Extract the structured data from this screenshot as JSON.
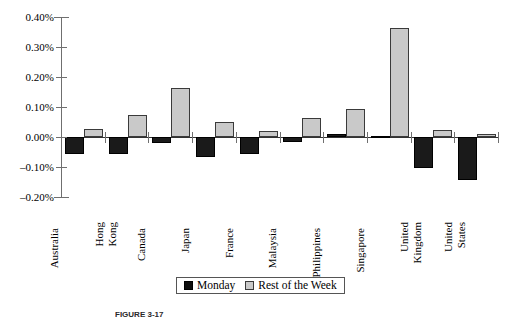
{
  "chart_data": {
    "type": "bar",
    "title": "",
    "subtitle": "",
    "xlabel": "",
    "ylabel": "",
    "ylim": [
      -0.2,
      0.4
    ],
    "ytick_values": [
      0.4,
      0.3,
      0.2,
      0.1,
      0.0,
      -0.1,
      -0.2
    ],
    "ytick_labels": [
      "0.40%",
      "0.30%",
      "0.20%",
      "0.10%",
      "0.00%",
      "–0.10%",
      "–0.20%"
    ],
    "grid": false,
    "legend_position": "bottom-center",
    "value_unit": "percent",
    "categories": [
      "Australia",
      "Hong Kong",
      "Canada",
      "Japan",
      "France",
      "Malaysia",
      "Philippines",
      "Singapore",
      "United Kingdom",
      "United States"
    ],
    "category_label_lines": [
      [
        "Australia"
      ],
      [
        "Hong",
        "Kong"
      ],
      [
        "Canada"
      ],
      [
        "Japan"
      ],
      [
        "France"
      ],
      [
        "Malaysia"
      ],
      [
        "Philippines"
      ],
      [
        "Singapore"
      ],
      [
        "United",
        "Kingdom"
      ],
      [
        "United",
        "States"
      ]
    ],
    "series": [
      {
        "name": "Monday",
        "color": "#1a1a1a",
        "values": [
          -0.055,
          -0.058,
          -0.02,
          -0.065,
          -0.055,
          -0.018,
          0.01,
          0.004,
          -0.103,
          -0.143
        ]
      },
      {
        "name": "Rest of the Week",
        "color": "#c9c9c9",
        "values": [
          0.027,
          0.074,
          0.163,
          0.05,
          0.021,
          0.065,
          0.092,
          0.365,
          0.024,
          0.011
        ]
      }
    ]
  },
  "legend": {
    "items": [
      {
        "label": "Monday",
        "swatch": "monday-swatch"
      },
      {
        "label": "Rest of the Week",
        "swatch": "rest-of-week-swatch"
      }
    ]
  },
  "caption": {
    "text": "FIGURE 3-17"
  }
}
